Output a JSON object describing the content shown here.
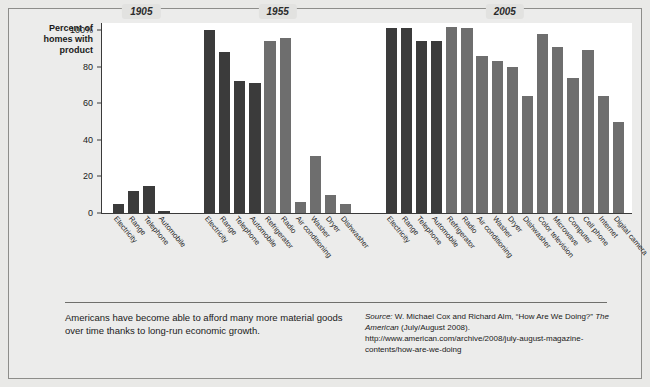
{
  "axis_title": "Percent of\nhomes with\nproduct",
  "footer": {
    "caption": "Americans have become able to afford many more material goods over time thanks to long-run economic growth.",
    "source_label": "Source:",
    "source_text": " W. Michael Cox and Richard Alm, “How Are We Doing?” ",
    "source_mag": "The American",
    "source_rest": " (July/August 2008). http://www.american.com/archive/2008/july-august-magazine-contents/how-are-we-doing"
  },
  "chart_data": {
    "type": "bar",
    "title": "",
    "xlabel": "",
    "ylabel": "Percent of homes with product",
    "ylim": [
      0,
      100
    ],
    "yticks": [
      0,
      20,
      40,
      60,
      80,
      100
    ],
    "ytick_labels": [
      "0",
      "20",
      "40",
      "60",
      "80",
      "100%"
    ],
    "grid": false,
    "legend": "none",
    "colors": {
      "dark": "#3b3b3b",
      "light": "#6e6e6e",
      "plot_bg": "#ffffff",
      "page_bg": "#e9e9e7",
      "axis": "#3a3a3a"
    },
    "groups": [
      {
        "year": "1905",
        "categories": [
          "Electricity",
          "Range",
          "Telephone",
          "Automobile"
        ],
        "values": [
          5,
          12,
          15,
          1
        ],
        "shades": [
          "dark",
          "dark",
          "dark",
          "dark"
        ]
      },
      {
        "year": "1955",
        "categories": [
          "Electricity",
          "Range",
          "Telephone",
          "Automobile",
          "Refrigerator",
          "Radio",
          "Air conditioning",
          "Washer",
          "Dryer",
          "Dishwasher"
        ],
        "values": [
          100,
          88,
          72,
          71,
          94,
          96,
          6,
          31,
          10,
          5
        ],
        "shades": [
          "dark",
          "dark",
          "dark",
          "dark",
          "light",
          "light",
          "light",
          "light",
          "light",
          "light"
        ]
      },
      {
        "year": "2005",
        "categories": [
          "Electricity",
          "Range",
          "Telephone",
          "Automobile",
          "Refrigerator",
          "Radio",
          "Air conditioning",
          "Washer",
          "Dryer",
          "Dishwasher",
          "Color television",
          "Microwave",
          "Computer",
          "Cell phone",
          "Internet",
          "Digital camera"
        ],
        "values": [
          101,
          101,
          94,
          94,
          102,
          101,
          86,
          83,
          80,
          64,
          98,
          91,
          74,
          89,
          64,
          50
        ],
        "shades": [
          "dark",
          "dark",
          "dark",
          "dark",
          "light",
          "light",
          "light",
          "light",
          "light",
          "light",
          "light",
          "light",
          "light",
          "light",
          "light",
          "light"
        ]
      }
    ]
  }
}
